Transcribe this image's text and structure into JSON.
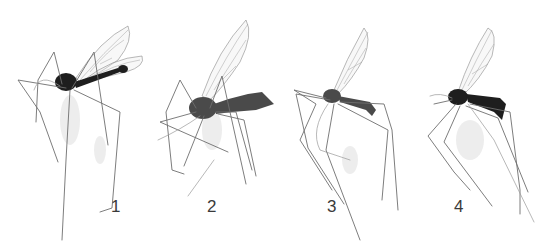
{
  "figure": {
    "background_color": "#ffffff",
    "panels": [
      {
        "label": "1",
        "specimen": "dark-bodied fly with slender black abdomen, wings spread"
      },
      {
        "label": "2",
        "specimen": "grey-bodied fly with thick abdomen, wing raised"
      },
      {
        "label": "3",
        "specimen": "pale fly with banded wing, long legs"
      },
      {
        "label": "4",
        "specimen": "dark fly with banded wing, curved abdomen"
      }
    ]
  }
}
